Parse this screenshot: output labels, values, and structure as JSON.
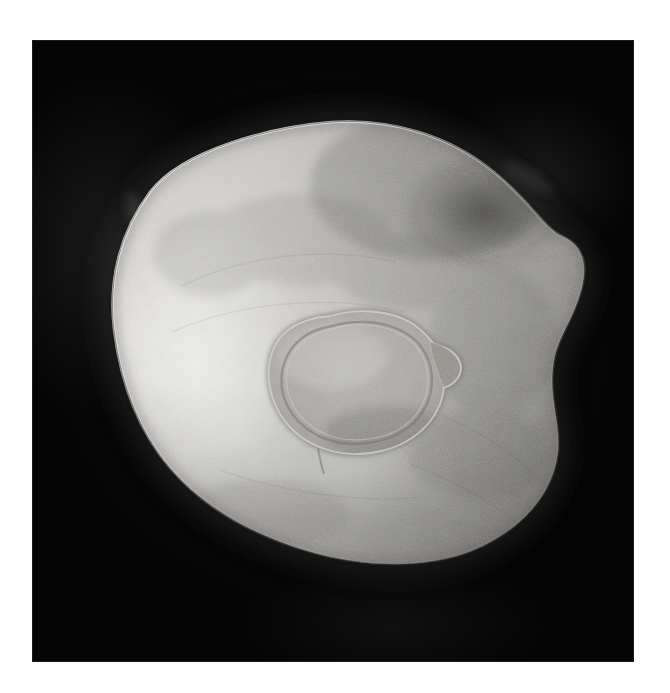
{
  "image": {
    "kind": "photograph",
    "subject": "hammered metal dish with central raised boss",
    "orientation": "top-down",
    "color_mode": "grayscale",
    "caption": "",
    "alt_text": "Overhead grayscale photograph of a shallow hammered metal dish with a raised circular boss at its centre, isolated on a black background"
  },
  "canvas": {
    "width": 670,
    "height": 693,
    "background_color": "#ffffff"
  },
  "plate": {
    "x": 32,
    "y": 40,
    "width": 602,
    "height": 622,
    "background_color": "#030303",
    "border_color": "#ffffff"
  },
  "object": {
    "name": "metal-dish",
    "center_x": 341,
    "center_y": 335,
    "bounds": {
      "left": 63,
      "top": 80,
      "right": 553,
      "bottom": 522
    },
    "silhouette_path": "M 300 82 C 360 78 418 96 462 132 C 498 161 512 188 530 196 C 551 205 556 224 550 248 C 542 280 526 296 522 322 C 516 358 530 384 526 414 C 520 458 486 492 440 511 C 392 530 330 527 278 512 C 222 496 172 468 138 428 C 104 388 88 338 82 290 C 76 240 88 192 118 152 C 150 110 238 87 300 82 Z",
    "boss_path": "M 298 276 C 326 268 356 270 378 282 C 392 290 398 300 404 306 C 414 306 424 312 428 322 C 432 334 424 344 412 348 C 410 368 398 386 380 398 C 356 414 322 418 296 410 C 268 402 248 382 240 356 C 232 330 238 304 256 290 C 268 281 283 277 298 276 Z",
    "boss_center_x": 330,
    "boss_center_y": 342,
    "boss_width": 196,
    "boss_height": 150
  },
  "tones": {
    "highlight": "#e2e0dc",
    "upper_mid": "#bdbbb6",
    "mid": "#a3a19c",
    "shadow_mid": "#87858087",
    "shadow": "#6d6b67",
    "deep_shadow": "#4c4a47",
    "rim_light": "#f1efec",
    "boss_face": "#9b9994",
    "boss_ring_light": "#cdcbc6",
    "boss_ring_dark": "#6a6865",
    "background": "#030303",
    "halo": "#2b2b2b"
  },
  "lighting": {
    "key_light_direction": "upper-left",
    "highlight_center_x": 150,
    "highlight_center_y": 330,
    "shadow_side": "upper-right"
  },
  "texture": {
    "type": "hammered",
    "grain": "fine mottled planishing marks",
    "grain_opacity": 0.3
  }
}
